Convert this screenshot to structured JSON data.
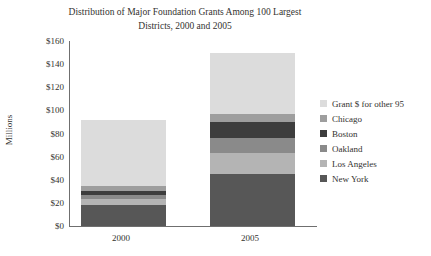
{
  "chart_data": {
    "type": "bar",
    "subtype": "stacked",
    "title": "Distribution of Major Foundation Grants Among 100 Largest Districts, 2000 and 2005",
    "title_line1": "Distribution of Major Foundation Grants Among 100 Largest",
    "title_line2": "Districts, 2000 and 2005",
    "xlabel": "",
    "ylabel": "Millions",
    "categories": [
      "2000",
      "2005"
    ],
    "ylim": [
      0,
      160
    ],
    "yticks": [
      "$0",
      "$20",
      "$40",
      "$60",
      "$80",
      "$100",
      "$120",
      "$140",
      "$160"
    ],
    "ytick_values": [
      0,
      20,
      40,
      60,
      80,
      100,
      120,
      140,
      160
    ],
    "grid": false,
    "legend_position": "right",
    "series": [
      {
        "name": "New York",
        "values": [
          18,
          45
        ],
        "color": "#575757"
      },
      {
        "name": "Los Angeles",
        "values": [
          5,
          18
        ],
        "color": "#b4b4b4"
      },
      {
        "name": "Oakland",
        "values": [
          4,
          13
        ],
        "color": "#8a8a8a"
      },
      {
        "name": "Boston",
        "values": [
          3,
          14
        ],
        "color": "#3d3d3d"
      },
      {
        "name": "Chicago",
        "values": [
          5,
          7
        ],
        "color": "#9e9e9e"
      },
      {
        "name": "Grant $ for other 95",
        "values": [
          57,
          53
        ],
        "color": "#dcdcdc"
      }
    ],
    "totals": [
      92,
      150
    ]
  },
  "legend": {
    "entries": [
      {
        "label": "Grant $ for other 95",
        "color": "#dcdcdc"
      },
      {
        "label": "Chicago",
        "color": "#9e9e9e"
      },
      {
        "label": "Boston",
        "color": "#3d3d3d"
      },
      {
        "label": "Oakland",
        "color": "#8a8a8a"
      },
      {
        "label": "Los Angeles",
        "color": "#b4b4b4"
      },
      {
        "label": "New York",
        "color": "#575757"
      }
    ]
  },
  "axis": {
    "line_color": "#6f6f6f"
  }
}
